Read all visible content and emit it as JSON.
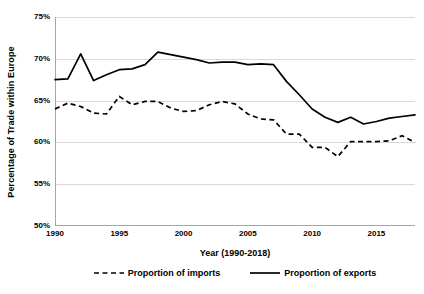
{
  "chart_data": {
    "type": "line",
    "title": "",
    "xlabel": "Year (1990-2018)",
    "ylabel": "Percentage of Trade within Europe",
    "xlim": [
      1990,
      2018
    ],
    "ylim": [
      50,
      75
    ],
    "ytick_labels": [
      "75%",
      "70%",
      "65%",
      "60%",
      "55%",
      "50%"
    ],
    "ytick_values": [
      75,
      70,
      65,
      60,
      55,
      50
    ],
    "xtick_labels": [
      "1990",
      "1995",
      "2000",
      "2005",
      "2010",
      "2015"
    ],
    "xtick_values": [
      1990,
      1995,
      2000,
      2005,
      2010,
      2015
    ],
    "grid": "horizontal",
    "legend_position": "bottom",
    "x": [
      1990,
      1991,
      1992,
      1993,
      1994,
      1995,
      1996,
      1997,
      1998,
      1999,
      2000,
      2001,
      2002,
      2003,
      2004,
      2005,
      2006,
      2007,
      2008,
      2009,
      2010,
      2011,
      2012,
      2013,
      2014,
      2015,
      2016,
      2017,
      2018
    ],
    "series": [
      {
        "name": "Proportion of imports",
        "style": "dashed",
        "color": "#000000",
        "values": [
          64.0,
          64.7,
          64.3,
          63.5,
          63.4,
          65.5,
          64.5,
          64.9,
          64.9,
          64.1,
          63.7,
          63.8,
          64.5,
          64.9,
          64.6,
          63.4,
          62.8,
          62.7,
          61.0,
          61.0,
          59.4,
          59.4,
          58.3,
          60.1,
          60.1,
          60.1,
          60.2,
          60.8,
          60.0
        ]
      },
      {
        "name": "Proportion of exports",
        "style": "solid",
        "color": "#000000",
        "values": [
          67.5,
          67.6,
          70.6,
          67.4,
          68.1,
          68.7,
          68.8,
          69.3,
          70.8,
          70.5,
          70.2,
          69.9,
          69.5,
          69.6,
          69.6,
          69.3,
          69.4,
          69.3,
          67.3,
          65.7,
          64.0,
          63.0,
          62.4,
          63.0,
          62.2,
          62.5,
          62.9,
          63.1,
          63.3
        ]
      }
    ]
  },
  "legend": {
    "entries": [
      {
        "label": "Proportion of imports",
        "swatch": "dashed-line-swatch"
      },
      {
        "label": "Proportion of exports",
        "swatch": "solid-line-swatch"
      }
    ]
  }
}
